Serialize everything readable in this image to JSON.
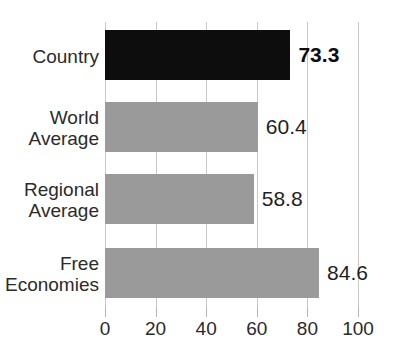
{
  "chart_data": {
    "type": "bar",
    "orientation": "horizontal",
    "title": "",
    "xlabel": "",
    "ylabel": "",
    "xlim": [
      0,
      100
    ],
    "grid": true,
    "legend": "none",
    "categories": [
      "Country",
      "World\nAverage",
      "Regional\nAverage",
      "Free\nEconomies"
    ],
    "values": [
      73.3,
      60.4,
      58.8,
      84.6
    ],
    "value_labels": [
      "73.3",
      "60.4",
      "58.8",
      "84.6"
    ],
    "xticks": [
      0,
      20,
      40,
      60,
      80,
      100
    ],
    "xtick_labels": [
      "0",
      "20",
      "40",
      "60",
      "80",
      "100"
    ],
    "bar_colors": [
      "#0d0d0d",
      "#9a9a9a",
      "#9a9a9a",
      "#9a9a9a"
    ],
    "highlight_index": 0,
    "colors": {
      "highlight": "#0d0d0d",
      "default_bar": "#9a9a9a",
      "gridline": "#c9c9c9",
      "text": "#2b2b2b",
      "background": "#ffffff"
    }
  },
  "axis": {
    "ticks": [
      {
        "label": "0",
        "value": 0
      },
      {
        "label": "20",
        "value": 20
      },
      {
        "label": "40",
        "value": 40
      },
      {
        "label": "60",
        "value": 60
      },
      {
        "label": "80",
        "value": 80
      },
      {
        "label": "100",
        "value": 100
      }
    ]
  },
  "bars": [
    {
      "label": "Country",
      "value": 73.3,
      "value_text": "73.3",
      "style": "dark",
      "bold": true
    },
    {
      "label": "World\nAverage",
      "value": 60.4,
      "value_text": "60.4",
      "style": "light",
      "bold": false
    },
    {
      "label": "Regional\nAverage",
      "value": 58.8,
      "value_text": "58.8",
      "style": "light",
      "bold": false
    },
    {
      "label": "Free\nEconomies",
      "value": 84.6,
      "value_text": "84.6",
      "style": "light",
      "bold": false
    }
  ]
}
